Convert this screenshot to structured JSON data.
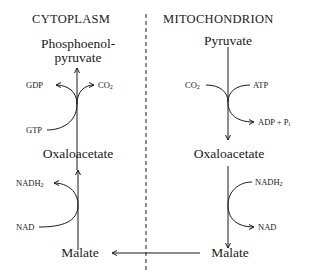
{
  "compartments": {
    "left": {
      "title": "CYTOPLASM"
    },
    "right": {
      "title": "MITOCHONDRION"
    }
  },
  "cytoplasm": {
    "top_metabolite_line1": "Phosphoenol-",
    "top_metabolite_line2": "pyruvate",
    "reaction1": {
      "input": "GTP",
      "output1": "GDP",
      "output2": "CO",
      "output2_sub": "2"
    },
    "middle_metabolite": "Oxaloacetate",
    "reaction2": {
      "input": "NAD",
      "output": "NADH",
      "output_sub": "2"
    },
    "bottom_metabolite": "Malate"
  },
  "mitochondrion": {
    "top_metabolite": "Pyruvate",
    "reaction1": {
      "input1": "CO",
      "input1_sub": "2",
      "input2": "ATP",
      "output": "ADP + P",
      "output_sub": "i"
    },
    "middle_metabolite": "Oxaloacetate",
    "reaction2": {
      "input": "NADH",
      "input_sub": "2",
      "output": "NAD"
    },
    "bottom_metabolite": "Malate"
  },
  "colors": {
    "ink": "#1a1a1a",
    "background": "#ffffff"
  }
}
